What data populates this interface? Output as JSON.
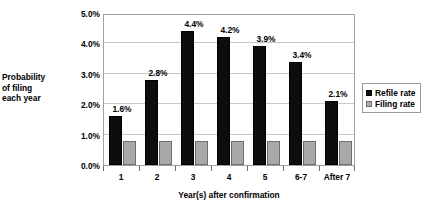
{
  "chart_data": {
    "type": "bar",
    "title": "",
    "xlabel": "Year(s) after confirmation",
    "ylabel": "Probability of filing each year",
    "ylabel_lines": [
      "Probability",
      "of filing",
      "each year"
    ],
    "categories": [
      "1",
      "2",
      "3",
      "4",
      "5",
      "6-7",
      "After 7"
    ],
    "series": [
      {
        "name": "Refile rate",
        "color": "#0d0d0d",
        "values": [
          1.6,
          2.8,
          4.4,
          4.2,
          3.9,
          3.4,
          2.1
        ],
        "labels": [
          "1.6%",
          "2.8%",
          "4.4%",
          "4.2%",
          "3.9%",
          "3.4%",
          "2.1%"
        ]
      },
      {
        "name": "Filing rate",
        "color": "#a9a9a9",
        "values": [
          0.8,
          0.8,
          0.8,
          0.8,
          0.8,
          0.8,
          0.8
        ],
        "labels": [
          "",
          "",
          "",
          "",
          "",
          "",
          ""
        ]
      }
    ],
    "ylim": [
      0,
      5
    ],
    "ytick_values": [
      0,
      1,
      2,
      3,
      4,
      5
    ],
    "ytick_labels": [
      "0.0%",
      "1.0%",
      "2.0%",
      "3.0%",
      "4.0%",
      "5.0%"
    ],
    "grid": true,
    "grid_axis": "y",
    "legend": {
      "position": "right",
      "entries": [
        "Refile rate",
        "Filing rate"
      ]
    }
  }
}
